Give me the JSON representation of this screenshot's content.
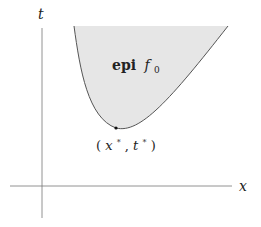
{
  "figure": {
    "axes": {
      "x_label": "x",
      "t_label": "t"
    },
    "region_label": {
      "bold": "epi",
      "func": "f",
      "sub": "0"
    },
    "point_label": "(x*, t*)",
    "point_label_parts": {
      "open": "(",
      "x": "x",
      "xstar": "*",
      "comma": ", ",
      "t": "t",
      "tstar": "*",
      "close": ")"
    },
    "colors": {
      "fill": "#e6e6e6",
      "curve": "#555555",
      "axis": "#777777",
      "point": "#111111"
    }
  }
}
